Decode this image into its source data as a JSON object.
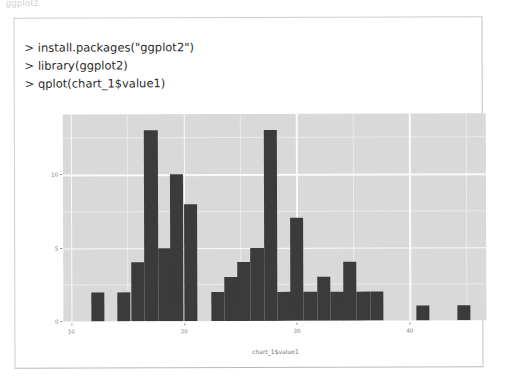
{
  "page": {
    "top_fragment": "ggplot2"
  },
  "console": {
    "lines": [
      "> install.packages(\"ggplot2\")",
      "> library(ggplot2)",
      "> qplot(chart_1$value1)"
    ]
  },
  "colors": {
    "bar_fill": "#3b3b3b",
    "panel_background": "#d9d9d9",
    "gridline_major": "#fafafa",
    "gridline_minor": "#eaeaea",
    "card_border": "#cdcdcd",
    "tick_text": "#7a7a7a",
    "console_text": "#2b2b2b"
  },
  "chart_data": {
    "type": "bar",
    "title": "",
    "subtitle": "",
    "xlabel": "chart_1$value1",
    "ylabel": "",
    "xlim": [
      9.3,
      46.8
    ],
    "ylim": [
      0,
      14.1
    ],
    "xticks": [
      10,
      20,
      30,
      40
    ],
    "yticks": [
      0,
      5,
      10
    ],
    "xticks_minor": [
      15,
      25,
      35,
      45
    ],
    "yticks_minor": [
      2.5,
      7.5,
      12.5
    ],
    "grid": true,
    "legend": false,
    "bin_width": 1.18,
    "bin_starts": [
      11.8,
      14.1,
      15.3,
      16.5,
      17.7,
      18.8,
      20.0,
      22.4,
      23.6,
      24.7,
      25.9,
      27.1,
      28.3,
      29.4,
      30.6,
      31.8,
      33.0,
      34.1,
      35.3,
      36.5,
      40.6,
      44.2
    ],
    "categories": [
      "11.8",
      "14.1",
      "15.3",
      "16.5",
      "17.7",
      "18.8",
      "20.0",
      "22.4",
      "23.6",
      "24.7",
      "25.9",
      "27.1",
      "28.3",
      "29.4",
      "30.6",
      "31.8",
      "33.0",
      "34.1",
      "35.3",
      "36.5",
      "40.6",
      "44.2"
    ],
    "values": [
      2,
      2,
      4,
      13,
      5,
      10,
      8,
      2,
      3,
      4,
      5,
      13,
      2,
      7,
      2,
      3,
      2,
      4,
      2,
      2,
      1,
      1
    ]
  },
  "icons": {}
}
